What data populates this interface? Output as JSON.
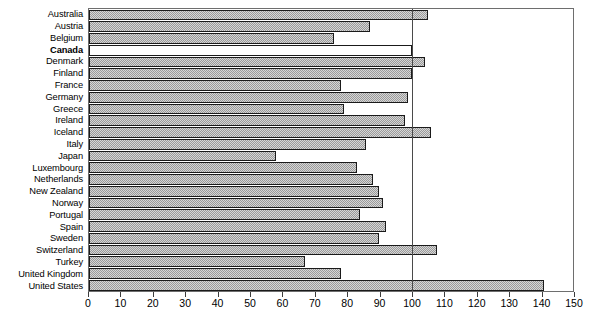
{
  "chart_data": {
    "type": "bar",
    "orientation": "horizontal",
    "title": "",
    "xlabel": "",
    "ylabel": "",
    "xlim": [
      0,
      150
    ],
    "xticks": [
      0,
      10,
      20,
      30,
      40,
      50,
      60,
      70,
      80,
      90,
      100,
      110,
      120,
      130,
      140,
      150
    ],
    "grid": false,
    "legend": null,
    "reference_line": 100,
    "highlight_category": "Canada",
    "colors": {
      "bar_fill": "#b3b3b3",
      "bar_border": "#1a1a1a",
      "highlight_pattern": "diagonal-hatch",
      "reference_line": "#4a4a4a",
      "frame": "#6e6e6e"
    },
    "categories": [
      "Australia",
      "Austria",
      "Belgium",
      "Canada",
      "Denmark",
      "Finland",
      "France",
      "Germany",
      "Greece",
      "Ireland",
      "Iceland",
      "Italy",
      "Japan",
      "Luxembourg",
      "Netherlands",
      "New Zealand",
      "Norway",
      "Portugal",
      "Spain",
      "Sweden",
      "Switzerland",
      "Turkey",
      "United Kingdom",
      "United States"
    ],
    "values": [
      105,
      87,
      76,
      100,
      104,
      100,
      78,
      99,
      79,
      98,
      106,
      86,
      58,
      83,
      88,
      90,
      91,
      84,
      92,
      90,
      108,
      67,
      78,
      141
    ]
  }
}
